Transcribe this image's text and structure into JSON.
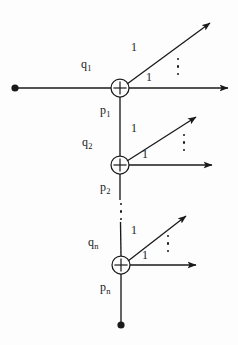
{
  "figure": {
    "type": "signal-flow-graph",
    "background_color": "#fdfdfd",
    "line_color": "#1a1a1a"
  },
  "nodes": [
    {
      "id": "adder-1",
      "symbol": "+",
      "cx": 120,
      "cy": 88,
      "r": 9,
      "input_label": "q",
      "input_subscript": "1",
      "output_label": "p",
      "output_subscript": "1"
    },
    {
      "id": "adder-2",
      "symbol": "+",
      "cx": 120,
      "cy": 165,
      "r": 9,
      "input_label": "q",
      "input_subscript": "2",
      "output_label": "p",
      "output_subscript": "2"
    },
    {
      "id": "adder-n",
      "symbol": "+",
      "cx": 121,
      "cy": 265,
      "r": 9,
      "input_label": "q",
      "input_subscript": "n",
      "output_label": "p",
      "output_subscript": "n"
    }
  ],
  "labels": {
    "q1": "q",
    "q1_sub": "1",
    "p1": "p",
    "p1_sub": "1",
    "q2": "q",
    "q2_sub": "2",
    "p2": "p",
    "p2_sub": "2",
    "qn": "q",
    "qn_sub": "n",
    "pn": "p",
    "pn_sub": "n",
    "gain_1_diag": "1",
    "gain_1_horiz": "1",
    "gain_2_diag": "1",
    "gain_2_horiz": "1",
    "gain_n_diag": "1",
    "gain_n_horiz": "1"
  },
  "ellipses": [
    {
      "id": "branch-dots-1",
      "x": 177,
      "y": 58,
      "count": 3
    },
    {
      "id": "branch-dots-2",
      "x": 183,
      "y": 134,
      "count": 3
    },
    {
      "id": "branch-dots-n",
      "x": 167,
      "y": 235,
      "count": 3
    },
    {
      "id": "cascade-dots",
      "x": 120,
      "y": 209,
      "count": 3
    }
  ],
  "terminals": [
    {
      "id": "source-terminal",
      "x": 15,
      "y": 88,
      "r": 3.6
    },
    {
      "id": "sink-terminal",
      "x": 121,
      "y": 325,
      "r": 3.6
    }
  ]
}
